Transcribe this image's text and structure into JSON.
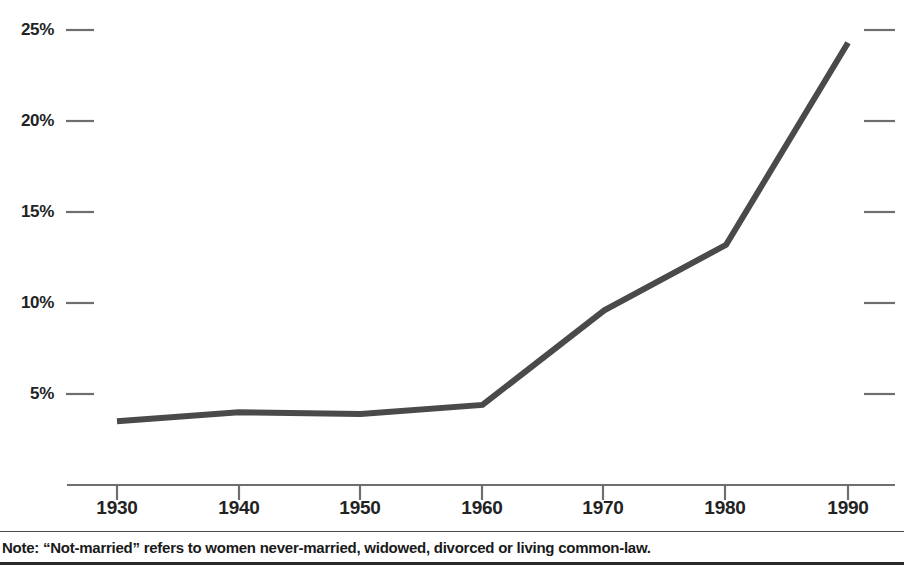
{
  "chart_data": {
    "type": "line",
    "title": "",
    "subtitle": "",
    "xlabel": "",
    "ylabel": "",
    "x": [
      1930,
      1940,
      1950,
      1960,
      1970,
      1980,
      1990
    ],
    "categories": [
      "1930",
      "1940",
      "1950",
      "1960",
      "1970",
      "1980",
      "1990"
    ],
    "values": [
      3.5,
      4.0,
      3.9,
      4.4,
      9.6,
      13.2,
      24.3
    ],
    "series": [
      {
        "name": "Not-married women",
        "values": [
          3.5,
          4.0,
          3.9,
          4.4,
          9.6,
          13.2,
          24.3
        ]
      }
    ],
    "xtick_labels": [
      "1930",
      "1940",
      "1950",
      "1960",
      "1970",
      "1980",
      "1990"
    ],
    "ytick_labels": [
      "5%",
      "10%",
      "15%",
      "20%",
      "25%"
    ],
    "ytick_values": [
      5,
      10,
      15,
      20,
      25
    ],
    "ylim": [
      0,
      26
    ],
    "xlim": [
      1925,
      1995
    ],
    "grid": false,
    "legend": "none",
    "line_color": "#4a4a4a",
    "axis_color": "#6e6e6e",
    "text_color": "#232323"
  },
  "axes": {
    "y_ticks": [
      {
        "label": "25%",
        "value": 25
      },
      {
        "label": "20%",
        "value": 20
      },
      {
        "label": "15%",
        "value": 15
      },
      {
        "label": "10%",
        "value": 10
      },
      {
        "label": "5%",
        "value": 5
      }
    ],
    "x_ticks": [
      {
        "label": "1930",
        "value": 1930
      },
      {
        "label": "1940",
        "value": 1940
      },
      {
        "label": "1950",
        "value": 1950
      },
      {
        "label": "1960",
        "value": 1960
      },
      {
        "label": "1970",
        "value": 1970
      },
      {
        "label": "1980",
        "value": 1980
      },
      {
        "label": "1990",
        "value": 1990
      }
    ]
  },
  "footer": {
    "note": "Note: “Not-married” refers to women never-married, widowed, divorced or living common-law."
  }
}
